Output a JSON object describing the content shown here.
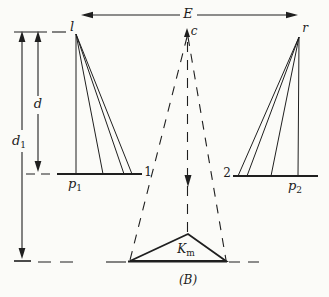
{
  "figure": {
    "caption": "(B)",
    "background": "#fbfbf8",
    "line_color": "#1f1f1f",
    "labels": {
      "span_e": "E",
      "left_center": "l",
      "mid_center": "c",
      "right_center": "r",
      "depth_d": "d",
      "depth_d1_base": "d",
      "depth_d1_sub": "1",
      "left_plane_base": "p",
      "left_plane_sub": "1",
      "right_plane_base": "p",
      "right_plane_sub": "2",
      "left_index": "1",
      "right_index": "2",
      "model_point_base": "K",
      "model_point_sub": "m"
    }
  }
}
